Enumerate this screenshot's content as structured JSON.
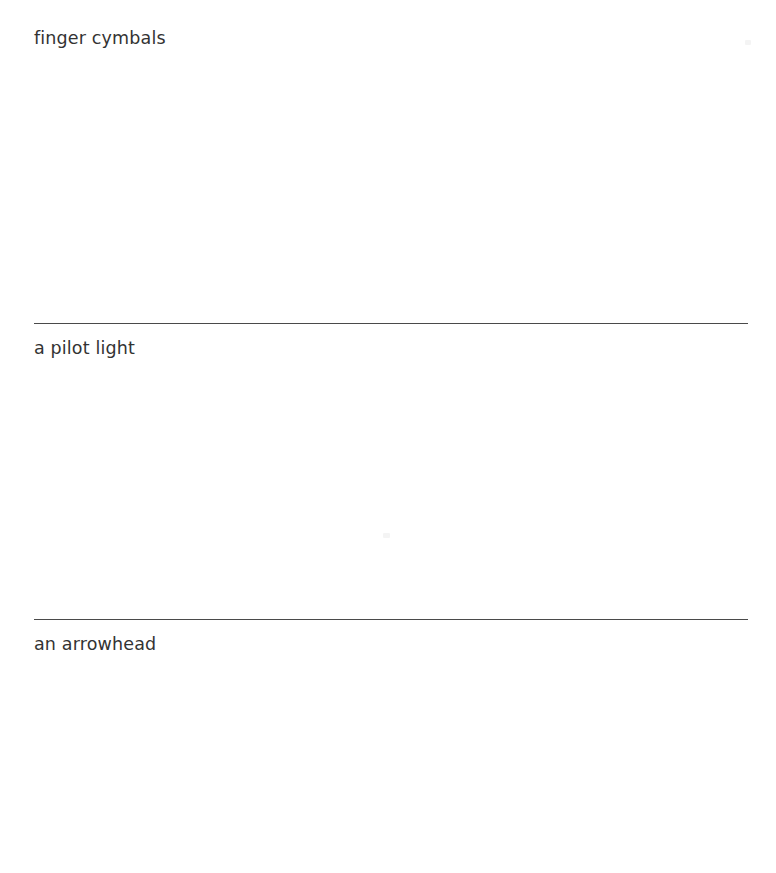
{
  "page": {
    "background_color": "#ffffff",
    "text_color": "#333333",
    "rule_color": "#4a4a4a",
    "width": 776,
    "height": 873
  },
  "entries": [
    {
      "label": "finger cymbals",
      "label_top": 30,
      "space_top": 56,
      "space_height": 266,
      "rule_top": 323,
      "has_rule": true
    },
    {
      "label": "a pilot light",
      "label_top": 340,
      "space_top": 366,
      "space_height": 252,
      "rule_top": 619,
      "has_rule": true
    },
    {
      "label": "an arrowhead",
      "label_top": 636,
      "space_top": 662,
      "space_height": 211,
      "rule_top": 0,
      "has_rule": false
    }
  ],
  "artifacts": [
    {
      "left": 745,
      "top": 40,
      "width": 6,
      "height": 5
    },
    {
      "left": 383,
      "top": 533,
      "width": 7,
      "height": 5
    }
  ]
}
